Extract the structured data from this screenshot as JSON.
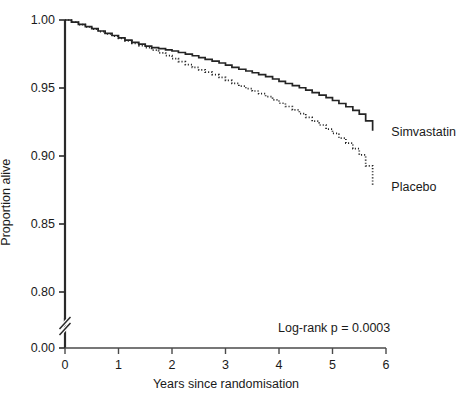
{
  "chart_data": {
    "type": "line",
    "title": "",
    "subtitle": "",
    "xlabel": "Years since randomisation",
    "ylabel": "Proportion alive",
    "xlim": [
      0,
      6
    ],
    "ylim": [
      0.78,
      1.0
    ],
    "grid": false,
    "legend_position": "right-inline",
    "y_axis_break": {
      "present": true,
      "between": [
        0.0,
        0.78
      ],
      "symbol": "double-slash"
    },
    "xticks": [
      0,
      1,
      2,
      3,
      4,
      5,
      6
    ],
    "xticklabels": [
      "0",
      "1",
      "2",
      "3",
      "4",
      "5",
      "6"
    ],
    "yticks": [
      0.0,
      0.8,
      0.85,
      0.9,
      0.95,
      1.0
    ],
    "yticklabels": [
      "0.00",
      "0.80",
      "0.85",
      "0.90",
      "0.95",
      "1.00"
    ],
    "annotations": [
      {
        "text": "Log-rank p = 0.0003",
        "x": 4.0,
        "y": 0.805
      }
    ],
    "series": [
      {
        "name": "Simvastatin",
        "style": "solid",
        "color": "#242424",
        "label_x": 5.95,
        "label_y": 0.9175,
        "x": [
          0.0,
          0.12,
          0.25,
          0.38,
          0.5,
          0.62,
          0.75,
          0.88,
          1.0,
          1.12,
          1.25,
          1.38,
          1.5,
          1.62,
          1.75,
          1.88,
          2.0,
          2.12,
          2.25,
          2.38,
          2.5,
          2.62,
          2.75,
          2.88,
          3.0,
          3.12,
          3.25,
          3.38,
          3.5,
          3.62,
          3.75,
          3.88,
          4.0,
          4.12,
          4.25,
          4.38,
          4.5,
          4.62,
          4.75,
          4.88,
          5.0,
          5.12,
          5.25,
          5.38,
          5.5,
          5.62,
          5.75
        ],
        "y": [
          1.0,
          0.9985,
          0.9968,
          0.9952,
          0.9936,
          0.9919,
          0.9902,
          0.9886,
          0.9869,
          0.9852,
          0.9836,
          0.9822,
          0.9808,
          0.9797,
          0.9789,
          0.9781,
          0.9772,
          0.9761,
          0.9749,
          0.9737,
          0.9724,
          0.9711,
          0.9698,
          0.9684,
          0.9668,
          0.9652,
          0.9638,
          0.9625,
          0.9612,
          0.9598,
          0.9583,
          0.9566,
          0.9549,
          0.9533,
          0.9518,
          0.9502,
          0.9484,
          0.9466,
          0.9448,
          0.9429,
          0.9408,
          0.9386,
          0.9362,
          0.9336,
          0.9308,
          0.9258,
          0.9185
        ]
      },
      {
        "name": "Placebo",
        "style": "dotted",
        "color": "#242424",
        "label_x": 5.95,
        "label_y": 0.8775,
        "x": [
          0.0,
          0.12,
          0.25,
          0.38,
          0.5,
          0.62,
          0.75,
          0.88,
          1.0,
          1.12,
          1.25,
          1.38,
          1.5,
          1.62,
          1.75,
          1.88,
          2.0,
          2.12,
          2.25,
          2.38,
          2.5,
          2.62,
          2.75,
          2.88,
          3.0,
          3.12,
          3.25,
          3.38,
          3.5,
          3.62,
          3.75,
          3.88,
          4.0,
          4.12,
          4.25,
          4.38,
          4.5,
          4.62,
          4.75,
          4.88,
          5.0,
          5.12,
          5.25,
          5.38,
          5.5,
          5.62,
          5.75
        ],
        "y": [
          1.0,
          0.9984,
          0.9966,
          0.9949,
          0.9932,
          0.9915,
          0.9898,
          0.9881,
          0.9864,
          0.9846,
          0.9828,
          0.9812,
          0.9796,
          0.9778,
          0.9758,
          0.9738,
          0.9716,
          0.9694,
          0.9672,
          0.9652,
          0.9634,
          0.9616,
          0.9598,
          0.9578,
          0.9556,
          0.9534,
          0.9514,
          0.9496,
          0.9478,
          0.9458,
          0.9436,
          0.9412,
          0.9388,
          0.9364,
          0.9339,
          0.9312,
          0.9284,
          0.9256,
          0.9228,
          0.9198,
          0.9166,
          0.9132,
          0.9095,
          0.9054,
          0.9008,
          0.8928,
          0.8782
        ]
      }
    ]
  }
}
